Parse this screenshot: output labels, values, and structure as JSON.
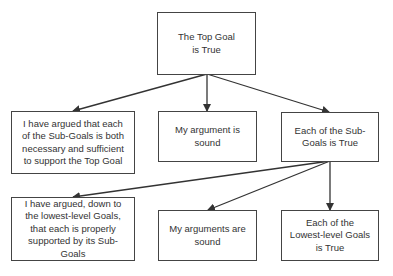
{
  "diagram": {
    "type": "goal-structure-tree",
    "nodes": [
      {
        "id": "top",
        "label": "The Top Goal\nis True",
        "lines": [
          "The Top Goal",
          "is True"
        ]
      },
      {
        "id": "argued-sub",
        "lines": [
          "I have argued that each",
          "of the Sub-Goals is both",
          "necessary and sufficient",
          "to support the Top Goal"
        ]
      },
      {
        "id": "argument-sound",
        "lines": [
          "My argument is",
          "sound"
        ]
      },
      {
        "id": "subgoals-true",
        "lines": [
          "Each of the Sub-",
          "Goals is True"
        ]
      },
      {
        "id": "argued-lowest",
        "lines": [
          "I have argued, down to",
          "the lowest-level Goals,",
          "that each is properly",
          "supported by its Sub-",
          "Goals"
        ]
      },
      {
        "id": "arguments-sound",
        "lines": [
          "My arguments are",
          "sound"
        ]
      },
      {
        "id": "lowest-true",
        "lines": [
          "Each of the",
          "Lowest-level Goals",
          "is True"
        ]
      }
    ],
    "edges": [
      {
        "from": "top",
        "to": "argued-sub"
      },
      {
        "from": "top",
        "to": "argument-sound"
      },
      {
        "from": "top",
        "to": "subgoals-true"
      },
      {
        "from": "subgoals-true",
        "to": "argued-lowest"
      },
      {
        "from": "subgoals-true",
        "to": "arguments-sound"
      },
      {
        "from": "subgoals-true",
        "to": "lowest-true"
      }
    ]
  },
  "colors": {
    "stroke": "#444444",
    "text": "#333333",
    "background": "#ffffff"
  }
}
